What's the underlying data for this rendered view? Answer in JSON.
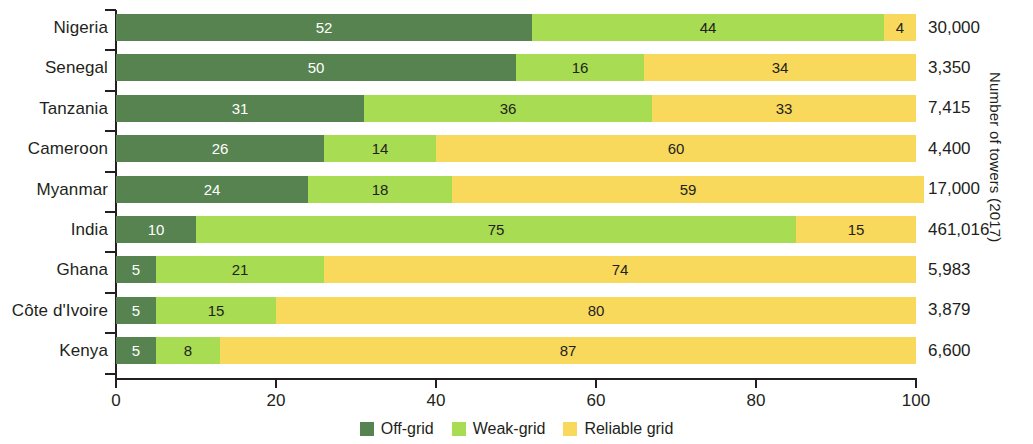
{
  "chart_data": {
    "type": "bar",
    "subtype": "stacked-horizontal-100pct",
    "title": "",
    "xlabel": "",
    "ylabel": "",
    "right_axis_title": "Number of towers (2017)",
    "xlim": [
      0,
      100
    ],
    "xticks": [
      0,
      20,
      40,
      60,
      80,
      100
    ],
    "xtick_labels": [
      "0",
      "20",
      "40",
      "60",
      "80",
      "100"
    ],
    "grid": false,
    "legend_position": "bottom-center",
    "categories": [
      "Nigeria",
      "Senegal",
      "Tanzania",
      "Cameroon",
      "Myanmar",
      "India",
      "Ghana",
      "Côte d'Ivoire",
      "Kenya"
    ],
    "series": [
      {
        "name": "Off-grid",
        "color": "#568350",
        "values": [
          52,
          50,
          31,
          26,
          24,
          10,
          5,
          5,
          5
        ]
      },
      {
        "name": "Weak-grid",
        "color": "#a8dc52",
        "values": [
          44,
          16,
          36,
          14,
          18,
          75,
          21,
          15,
          8
        ]
      },
      {
        "name": "Reliable grid",
        "color": "#f8d95c",
        "values": [
          4,
          34,
          33,
          60,
          59,
          15,
          74,
          80,
          87
        ]
      }
    ],
    "annotations": [
      {
        "category": "Nigeria",
        "towers": "30,000"
      },
      {
        "category": "Senegal",
        "towers": "3,350"
      },
      {
        "category": "Tanzania",
        "towers": "7,415"
      },
      {
        "category": "Cameroon",
        "towers": "4,400"
      },
      {
        "category": "Myanmar",
        "towers": "17,000"
      },
      {
        "category": "India",
        "towers": "461,016"
      },
      {
        "category": "Ghana",
        "towers": "5,983"
      },
      {
        "category": "Côte d'Ivoire",
        "towers": "3,879"
      },
      {
        "category": "Kenya",
        "towers": "6,600"
      }
    ]
  },
  "rows": [
    {
      "category": "Nigeria",
      "offgrid": 52,
      "weak": 44,
      "reliable": 4,
      "offgrid_label": "52",
      "weak_label": "44",
      "reliable_label": "4",
      "towers": "30,000"
    },
    {
      "category": "Senegal",
      "offgrid": 50,
      "weak": 16,
      "reliable": 34,
      "offgrid_label": "50",
      "weak_label": "16",
      "reliable_label": "34",
      "towers": "3,350"
    },
    {
      "category": "Tanzania",
      "offgrid": 31,
      "weak": 36,
      "reliable": 33,
      "offgrid_label": "31",
      "weak_label": "36",
      "reliable_label": "33",
      "towers": "7,415"
    },
    {
      "category": "Cameroon",
      "offgrid": 26,
      "weak": 14,
      "reliable": 60,
      "offgrid_label": "26",
      "weak_label": "14",
      "reliable_label": "60",
      "towers": "4,400"
    },
    {
      "category": "Myanmar",
      "offgrid": 24,
      "weak": 18,
      "reliable": 59,
      "offgrid_label": "24",
      "weak_label": "18",
      "reliable_label": "59",
      "towers": "17,000"
    },
    {
      "category": "India",
      "offgrid": 10,
      "weak": 75,
      "reliable": 15,
      "offgrid_label": "10",
      "weak_label": "75",
      "reliable_label": "15",
      "towers": "461,016"
    },
    {
      "category": "Ghana",
      "offgrid": 5,
      "weak": 21,
      "reliable": 74,
      "offgrid_label": "5",
      "weak_label": "21",
      "reliable_label": "74",
      "towers": "5,983"
    },
    {
      "category": "Côte d'Ivoire",
      "offgrid": 5,
      "weak": 15,
      "reliable": 80,
      "offgrid_label": "5",
      "weak_label": "15",
      "reliable_label": "80",
      "towers": "3,879"
    },
    {
      "category": "Kenya",
      "offgrid": 5,
      "weak": 8,
      "reliable": 87,
      "offgrid_label": "5",
      "weak_label": "8",
      "reliable_label": "87",
      "towers": "6,600"
    }
  ],
  "xaxis": {
    "ticks": [
      "0",
      "20",
      "40",
      "60",
      "80",
      "100"
    ]
  },
  "right_axis": {
    "title": "Number of towers (2017)"
  },
  "legend": {
    "items": [
      {
        "label": "Off-grid",
        "color": "#568350"
      },
      {
        "label": "Weak-grid",
        "color": "#a8dc52"
      },
      {
        "label": "Reliable grid",
        "color": "#f8d95c"
      }
    ]
  }
}
